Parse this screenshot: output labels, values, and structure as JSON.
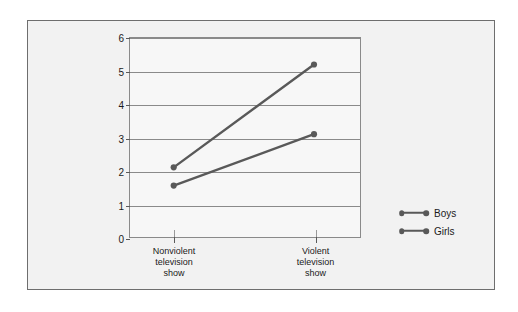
{
  "chart_data": {
    "type": "line",
    "title": "",
    "subtitle": "",
    "xlabel": "",
    "ylabel": "Average duration of aggressive responses",
    "ylabel_lines": [
      "Average duration of",
      "aggressive responses"
    ],
    "categories": [
      "Nonviolent television show",
      "Violent television show"
    ],
    "category_lines": [
      [
        "Nonviolent",
        "television",
        "show"
      ],
      [
        "Violent",
        "television",
        "show"
      ]
    ],
    "series": [
      {
        "name": "Boys",
        "values": [
          2.1,
          5.2
        ],
        "color": "#595959"
      },
      {
        "name": "Girls",
        "values": [
          1.55,
          3.1
        ],
        "color": "#595959"
      }
    ],
    "ylim": [
      0,
      6
    ],
    "yticks": [
      0,
      1,
      2,
      3,
      4,
      5,
      6
    ],
    "ytick_labels": [
      "0",
      "1",
      "2",
      "3",
      "4",
      "5",
      "6"
    ],
    "grid": true,
    "grid_axis": "y",
    "legend_position": "right",
    "legend_entries": [
      "Boys",
      "Girls"
    ]
  },
  "figure": {
    "panel_background": "#f2f2f2",
    "panel_border_color": "#6e6e6e",
    "plot_background": "#f7f7f7",
    "plot_border_color": "#8a8a8a",
    "gridline_color": "#8a8a8a",
    "text_color": "#1a1a1a",
    "series_color": "#595959"
  }
}
